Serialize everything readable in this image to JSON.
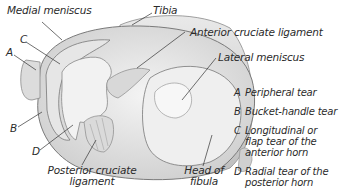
{
  "figure": {
    "labels": {
      "medial_meniscus": "Medial meniscus",
      "tibia": "Tibia",
      "anterior_cruciate_ligament": "Anterior cruciate ligament",
      "lateral_meniscus": "Lateral meniscus",
      "posterior_cruciate_ligament_line1": "Posterior cruciate",
      "posterior_cruciate_ligament_line2": "ligament",
      "head_of_fibula_line1": "Head of",
      "head_of_fibula_line2": "fibula",
      "marker_a": "A",
      "marker_b": "B",
      "marker_c": "C",
      "marker_d": "D"
    },
    "legend": [
      {
        "key": "A",
        "lines": [
          "Peripheral tear"
        ]
      },
      {
        "key": "B",
        "lines": [
          "Bucket-handle tear"
        ]
      },
      {
        "key": "C",
        "lines": [
          "Longitudinal or",
          "flap tear of the",
          "anterior horn"
        ]
      },
      {
        "key": "D",
        "lines": [
          "Radial tear of the",
          "posterior horn"
        ]
      }
    ]
  }
}
